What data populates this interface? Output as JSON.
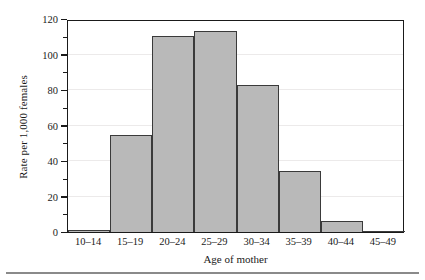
{
  "chart_data": {
    "type": "bar",
    "title": "",
    "xlabel": "Age of mother",
    "ylabel": "Rate per 1,000 females",
    "categories": [
      "10–14",
      "15–19",
      "20–24",
      "25–29",
      "30–34",
      "35–39",
      "40–44",
      "45–49"
    ],
    "values": [
      1,
      54.5,
      110.5,
      113.5,
      83,
      34.5,
      6,
      0.3
    ],
    "ylim": [
      0,
      120
    ],
    "yticks": [
      0,
      20,
      40,
      60,
      80,
      100,
      120
    ],
    "ytick_labels": [
      "0",
      "20",
      "40",
      "60",
      "80",
      "100",
      "120"
    ],
    "yminor_ticks": [
      10,
      30,
      50,
      70,
      90,
      110
    ],
    "grid": true,
    "legend": null,
    "bar_fill_color": "#b9b9b9",
    "bar_edge_color": "#3a3a3a",
    "gridline_color": "#eceaea",
    "axis_color": "#1a1a1a"
  }
}
